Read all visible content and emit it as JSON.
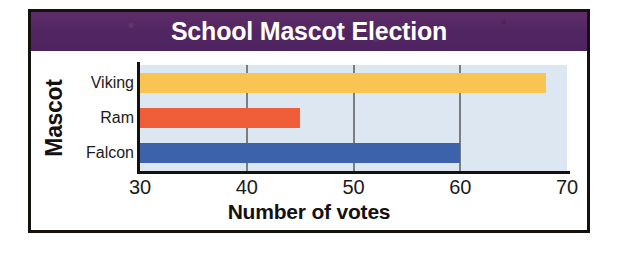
{
  "chart_data": {
    "type": "bar",
    "orientation": "horizontal",
    "title": "School Mascot Election",
    "categories": [
      "Viking",
      "Ram",
      "Falcon"
    ],
    "values": [
      68,
      45,
      60
    ],
    "xlabel": "Number of votes",
    "ylabel": "Mascot",
    "xlim": [
      30,
      70
    ],
    "xticks": [
      30,
      40,
      50,
      60,
      70
    ],
    "xtick_labels": [
      "30",
      "40",
      "50",
      "60",
      "70"
    ],
    "gridlines": [
      40,
      50,
      60
    ],
    "grid": true,
    "legend": "none",
    "bar_colors": [
      "#f9c452",
      "#ef5e38",
      "#3b62ab"
    ],
    "plot_background": "#dce7f2",
    "title_background": "#582a63",
    "title_color": "#ffffff",
    "gridline_color": "#7a7d82",
    "axis_color": "#14110f",
    "border_color": "#14110f"
  }
}
